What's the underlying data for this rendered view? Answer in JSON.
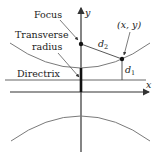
{
  "diagram": {
    "title": "",
    "labels": {
      "focus": "Focus",
      "transverse_line1": "Transverse",
      "transverse_line2": "radius",
      "directrix": "Directrix",
      "point": "(x, y)",
      "d2_base": "d",
      "d2_sub": "2",
      "d1_base": "d",
      "d1_sub": "1",
      "x_axis": "x",
      "y_axis": "y"
    },
    "colors": {
      "curve": "#7a7a7a",
      "axis": "#333333",
      "text": "#222222",
      "background": "#ffffff"
    }
  }
}
